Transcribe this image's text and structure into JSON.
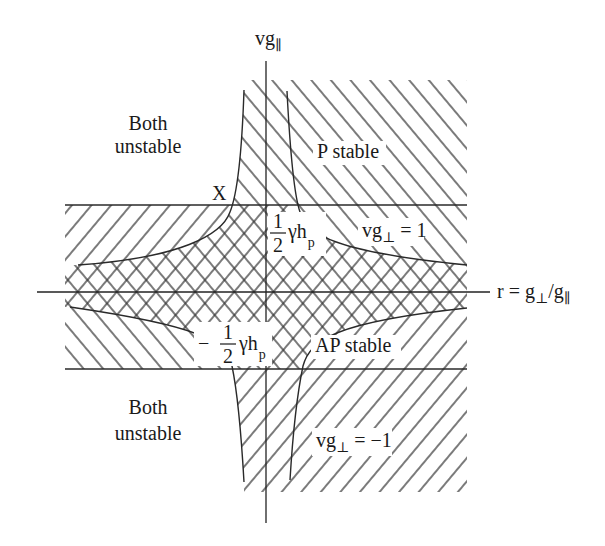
{
  "axes": {
    "vertical": {
      "base": "vg",
      "sub": "∥"
    },
    "horizontal": {
      "lead": "r = g",
      "sub1": "⊥",
      "mid": "/g",
      "sub2": "∥"
    }
  },
  "regions": {
    "both_unstable_top": [
      "Both",
      "unstable"
    ],
    "both_unstable_bottom": [
      "Both",
      "unstable"
    ],
    "p_stable": "P stable",
    "ap_stable": "AP stable"
  },
  "annotations": {
    "crossing_point": "X",
    "upper_line": {
      "base": "vg",
      "sub": "⊥",
      "rest": " = 1"
    },
    "lower_line": {
      "base": "vg",
      "sub": "⊥",
      "rest": " = −1"
    },
    "upper_gap": {
      "num": "1",
      "den": "2",
      "expr": "γh",
      "sub": "p"
    },
    "lower_gap": {
      "sign": "−",
      "num": "1",
      "den": "2",
      "expr": "γh",
      "sub": "p"
    }
  },
  "hatching": {
    "p_stable": "backslash diagonal hatch",
    "ap_stable": "forward-slash diagonal hatch",
    "overlap": "cross-hatch (both stable)"
  },
  "colors": {
    "line": "#2a2a2a",
    "background": "#ffffff"
  }
}
